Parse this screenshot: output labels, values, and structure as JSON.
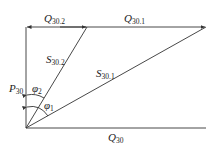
{
  "diagram": {
    "labels": {
      "q302": {
        "main": "Q",
        "sub": "30.2"
      },
      "q301": {
        "main": "Q",
        "sub": "30.1"
      },
      "s302": {
        "main": "S",
        "sub": "30.2"
      },
      "s301": {
        "main": "S",
        "sub": "30.1"
      },
      "p30": {
        "main": "P",
        "sub": "30"
      },
      "phi2": {
        "main": "φ",
        "sub": "2"
      },
      "phi1": {
        "main": "φ",
        "sub": "1"
      },
      "q30": {
        "main": "Q",
        "sub": "30"
      }
    },
    "line_color": "#333333"
  }
}
